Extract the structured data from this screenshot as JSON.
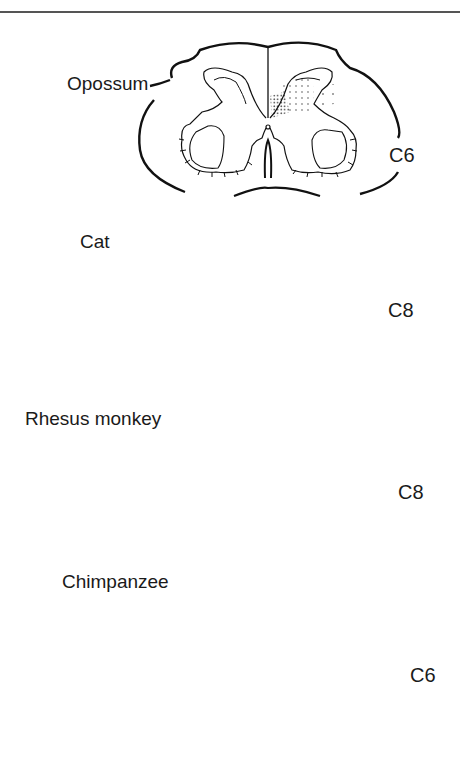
{
  "figure": {
    "sections": [
      {
        "species": "Opossum",
        "segment": "C6"
      },
      {
        "species": "Cat",
        "segment": "C8"
      },
      {
        "species": "Rhesus monkey",
        "segment": "C8"
      },
      {
        "species": "Chimpanzee",
        "segment": "C6"
      }
    ]
  }
}
